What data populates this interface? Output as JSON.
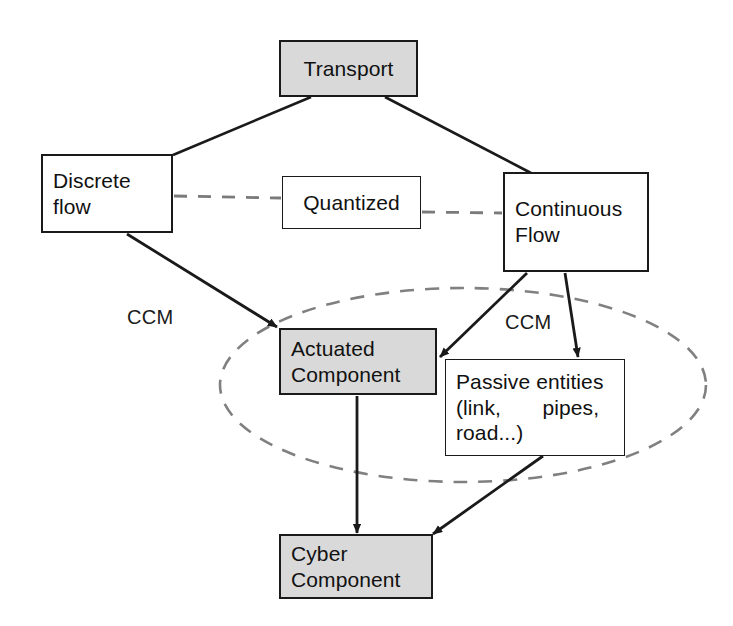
{
  "diagram": {
    "background_color": "#ffffff",
    "stroke_color": "#1a1a1a",
    "shaded_fill": "#d9d9d9",
    "dashed_color": "#808080"
  },
  "nodes": {
    "transport": {
      "label": "Transport",
      "lines": [
        "Transport"
      ],
      "fill": "shaded",
      "x": 279,
      "y": 40,
      "w": 139,
      "h": 57
    },
    "discrete_flow": {
      "label": "Discrete flow",
      "lines": [
        "Discrete",
        "flow"
      ],
      "fill": "white",
      "x": 41,
      "y": 154,
      "w": 132,
      "h": 79
    },
    "quantized": {
      "label": "Quantized",
      "lines": [
        "Quantized"
      ],
      "fill": "white",
      "x": 282,
      "y": 176,
      "w": 139,
      "h": 53
    },
    "continuous_flow": {
      "label": "Continuous Flow",
      "lines": [
        "Continuous",
        "Flow"
      ],
      "fill": "white",
      "x": 503,
      "y": 172,
      "w": 146,
      "h": 100
    },
    "actuated_component": {
      "label": "Actuated Component",
      "lines": [
        "Actuated",
        "Component"
      ],
      "fill": "shaded",
      "x": 279,
      "y": 328,
      "w": 158,
      "h": 67
    },
    "passive_entities": {
      "label": "Passive entities (link, pipes, road...)",
      "lines": [
        "Passive entities",
        "(link,       pipes,",
        "road...)"
      ],
      "fill": "white",
      "x": 445,
      "y": 359,
      "w": 180,
      "h": 97
    },
    "cyber_component": {
      "label": "Cyber Component",
      "lines": [
        "Cyber",
        "Component"
      ],
      "fill": "shaded",
      "x": 279,
      "y": 534,
      "w": 154,
      "h": 65
    }
  },
  "edge_labels": [
    {
      "id": "ccm-left",
      "text": "CCM",
      "x": 127,
      "y": 306
    },
    {
      "id": "ccm-right",
      "text": "CCM",
      "x": 505,
      "y": 311
    }
  ],
  "edges": [
    {
      "id": "transport-to-discrete-flow",
      "from": "transport",
      "to": "discrete_flow",
      "style": "solid",
      "arrow": false
    },
    {
      "id": "transport-to-continuous-flow",
      "from": "transport",
      "to": "continuous_flow",
      "style": "solid",
      "arrow": false
    },
    {
      "id": "discrete-flow-to-quantized",
      "from": "discrete_flow",
      "to": "quantized",
      "style": "dashed",
      "arrow": false
    },
    {
      "id": "quantized-to-continuous-flow",
      "from": "quantized",
      "to": "continuous_flow",
      "style": "dashed",
      "arrow": false
    },
    {
      "id": "discrete-flow-to-actuated-component",
      "from": "discrete_flow",
      "to": "actuated_component",
      "style": "solid",
      "arrow": true
    },
    {
      "id": "continuous-flow-to-actuated-component",
      "from": "continuous_flow",
      "to": "actuated_component",
      "style": "solid",
      "arrow": true
    },
    {
      "id": "continuous-flow-to-passive-entities",
      "from": "continuous_flow",
      "to": "passive_entities",
      "style": "solid",
      "arrow": true
    },
    {
      "id": "actuated-component-to-cyber-component",
      "from": "actuated_component",
      "to": "cyber_component",
      "style": "solid",
      "arrow": true
    },
    {
      "id": "passive-entities-to-cyber-component",
      "from": "passive_entities",
      "to": "cyber_component",
      "style": "solid",
      "arrow": true
    }
  ],
  "grouping": {
    "id": "cyber-physical-group",
    "shape": "ellipse",
    "style": "dashed",
    "cx": 463,
    "cy": 385,
    "rx": 243,
    "ry": 97
  }
}
